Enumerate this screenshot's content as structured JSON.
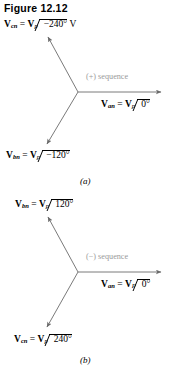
{
  "figure": {
    "title": "Figure 12.12",
    "caption_a": "(a)",
    "caption_b": "(b)"
  },
  "colors": {
    "phasor_line": "#6b6b6b",
    "text": "#000000",
    "sequence_text": "#9a9a9a",
    "background": "#ffffff"
  },
  "diagram_a": {
    "sequence_label": "(+) sequence",
    "phasors": [
      {
        "name": "Vcn",
        "prefix": "V",
        "subscript": "cn",
        "equals": "=",
        "magnitude": "V",
        "magnitude_subscript": "p",
        "angle": "−240°",
        "unit": "V",
        "angle_deg": 120
      },
      {
        "name": "Van",
        "prefix": "V",
        "subscript": "an",
        "equals": "=",
        "magnitude": "V",
        "magnitude_subscript": "p",
        "angle": "0°",
        "unit": "",
        "angle_deg": 0
      },
      {
        "name": "Vbn",
        "prefix": "V",
        "subscript": "bn",
        "equals": "=",
        "magnitude": "V",
        "magnitude_subscript": "p",
        "angle": "−120°",
        "unit": "",
        "angle_deg": 240
      }
    ]
  },
  "diagram_b": {
    "sequence_label": "(−) sequence",
    "phasors": [
      {
        "name": "Vbn",
        "prefix": "V",
        "subscript": "bn",
        "equals": "=",
        "magnitude": "V",
        "magnitude_subscript": "p",
        "angle": "120°",
        "unit": "",
        "angle_deg": 120
      },
      {
        "name": "Van",
        "prefix": "V",
        "subscript": "an",
        "equals": "=",
        "magnitude": "V",
        "magnitude_subscript": "P",
        "angle": "0°",
        "unit": "",
        "angle_deg": 0
      },
      {
        "name": "Vcn",
        "prefix": "V",
        "subscript": "cn",
        "equals": "=",
        "magnitude": "V",
        "magnitude_subscript": "p",
        "angle": "240°",
        "unit": "",
        "angle_deg": 240
      }
    ]
  }
}
